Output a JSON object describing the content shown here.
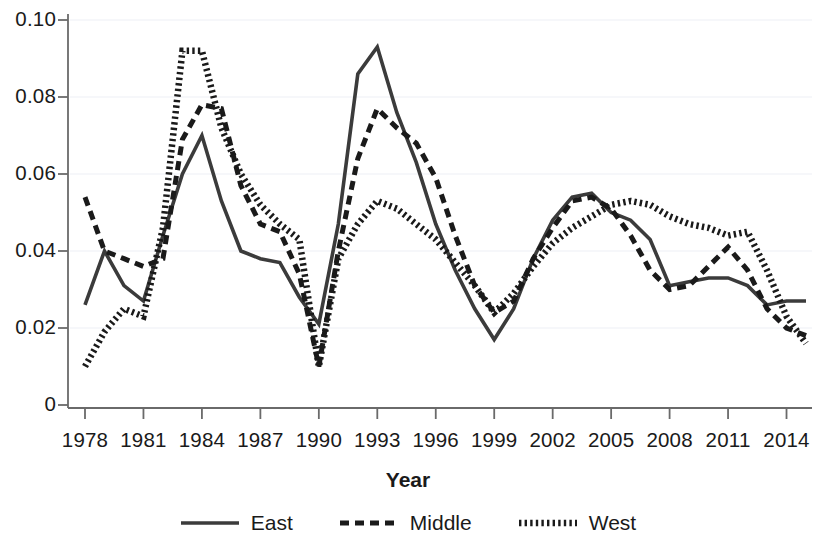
{
  "chart_data": {
    "type": "line",
    "title": "",
    "xlabel": "Year",
    "ylabel": "",
    "xlim": [
      1978,
      2015
    ],
    "ylim": [
      0,
      0.1
    ],
    "grid": true,
    "grid_axis": "y",
    "legend_position": "bottom",
    "x_tick_labels": [
      "1978",
      "1981",
      "1984",
      "1987",
      "1990",
      "1993",
      "1996",
      "1999",
      "2002",
      "2005",
      "2008",
      "2011",
      "2014"
    ],
    "x_tick_values": [
      1978,
      1981,
      1984,
      1987,
      1990,
      1993,
      1996,
      1999,
      2002,
      2005,
      2008,
      2011,
      2014
    ],
    "y_tick_labels": [
      "0",
      "0.02",
      "0.04",
      "0.06",
      "0.08",
      "0.10"
    ],
    "y_tick_values": [
      0,
      0.02,
      0.04,
      0.06,
      0.08,
      0.1
    ],
    "x": [
      1978,
      1979,
      1980,
      1981,
      1982,
      1983,
      1984,
      1985,
      1986,
      1987,
      1988,
      1989,
      1990,
      1991,
      1992,
      1993,
      1994,
      1995,
      1996,
      1997,
      1998,
      1999,
      2000,
      2001,
      2002,
      2003,
      2004,
      2005,
      2006,
      2007,
      2008,
      2009,
      2010,
      2011,
      2012,
      2013,
      2014,
      2015
    ],
    "series": [
      {
        "name": "East",
        "style": "solid",
        "color": "#3b3b3b",
        "values": [
          0.026,
          0.04,
          0.031,
          0.027,
          0.044,
          0.06,
          0.07,
          0.053,
          0.04,
          0.038,
          0.037,
          0.028,
          0.021,
          0.047,
          0.086,
          0.093,
          0.076,
          0.063,
          0.047,
          0.035,
          0.025,
          0.017,
          0.025,
          0.038,
          0.048,
          0.054,
          0.055,
          0.05,
          0.048,
          0.043,
          0.031,
          0.032,
          0.033,
          0.033,
          0.031,
          0.026,
          0.027,
          0.027
        ]
      },
      {
        "name": "Middle",
        "style": "dashed",
        "color": "#1a1a1a",
        "values": [
          0.054,
          0.04,
          0.038,
          0.036,
          0.038,
          0.069,
          0.078,
          0.077,
          0.057,
          0.047,
          0.045,
          0.034,
          0.01,
          0.04,
          0.064,
          0.077,
          0.072,
          0.068,
          0.059,
          0.044,
          0.031,
          0.024,
          0.027,
          0.038,
          0.046,
          0.053,
          0.054,
          0.051,
          0.044,
          0.035,
          0.03,
          0.031,
          0.036,
          0.041,
          0.035,
          0.025,
          0.02,
          0.018
        ]
      },
      {
        "name": "West",
        "style": "dotted",
        "color": "#1a1a1a",
        "values": [
          0.01,
          0.019,
          0.025,
          0.023,
          0.046,
          0.092,
          0.092,
          0.072,
          0.06,
          0.052,
          0.047,
          0.043,
          0.01,
          0.038,
          0.047,
          0.053,
          0.051,
          0.047,
          0.043,
          0.037,
          0.031,
          0.024,
          0.029,
          0.036,
          0.042,
          0.046,
          0.049,
          0.052,
          0.053,
          0.052,
          0.049,
          0.047,
          0.046,
          0.044,
          0.045,
          0.035,
          0.023,
          0.016
        ]
      }
    ]
  },
  "legend": {
    "items": [
      {
        "label": "East",
        "style": "solid"
      },
      {
        "label": "Middle",
        "style": "dashed"
      },
      {
        "label": "West",
        "style": "dotted"
      }
    ]
  },
  "axes": {
    "x_title": "Year"
  },
  "colors": {
    "line": "#2b2b2b",
    "axis": "#5a5a5a",
    "grid": "#eef0f5",
    "text": "#1a1a1a"
  }
}
